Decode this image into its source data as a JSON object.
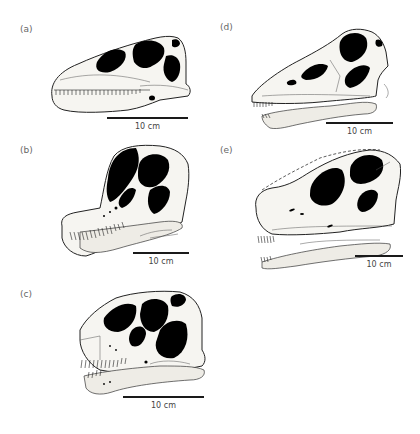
{
  "figure": {
    "panels": [
      {
        "id": "a",
        "label": "(a)",
        "scale_label": "10 cm",
        "description": "sauropod skull, long low snout, lateral view"
      },
      {
        "id": "b",
        "label": "(b)",
        "scale_label": "10 cm",
        "description": "sauropod skull, tall domed, lateral view"
      },
      {
        "id": "c",
        "label": "(c)",
        "scale_label": "10 cm",
        "description": "sauropod skull, short deep, lateral view"
      },
      {
        "id": "d",
        "label": "(d)",
        "scale_label": "10 cm",
        "description": "sauropod skull, elongate snout with lower jaw, lateral view"
      },
      {
        "id": "e",
        "label": "(e)",
        "scale_label": "10 cm",
        "description": "sauropod skull with dashed reconstructed outline, lateral view"
      }
    ],
    "colors": {
      "background": "#ffffff",
      "ink": "#1a1a1a",
      "bone": "#f6f5f1",
      "fenestra": "#000000",
      "label": "#666666"
    }
  }
}
